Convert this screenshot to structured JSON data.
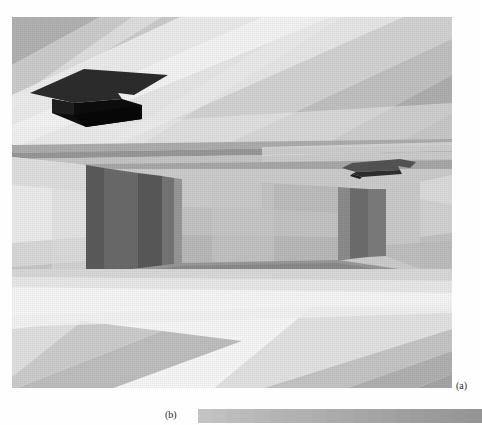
{
  "figure": {
    "panels": [
      {
        "id": "a",
        "label": "(a)",
        "caption_position": "bottom-right",
        "description": "grayscale radiosity rendering of an interior hall with two recessed ceiling luminaires"
      },
      {
        "id": "b",
        "label": "(b)",
        "caption_position": "left",
        "description": "horizontal grayscale intensity scale bar"
      }
    ]
  },
  "scene": {
    "name": "interior-hall-radiosity-render",
    "colors": {
      "ceiling_base": "#d4d4d4",
      "ceiling_bright": "#f4f4f4",
      "ceiling_mid": "#e2e2e2",
      "ceiling_dark": "#b9b9b9",
      "ceiling_darker": "#a6a6a6",
      "beam_face": "#c6c6c6",
      "beam_shadow": "#9d9d9d",
      "beam_highlight": "#ededed",
      "wall_left_light": "#f0f0f0",
      "wall_left_mid": "#dedede",
      "wall_back": "#c9c9c9",
      "wall_back_mid": "#bdbdbd",
      "wall_right": "#d9d9d9",
      "doorway_dark": "#6e6e6e",
      "doorway_darker": "#5a5a5a",
      "pillar": "#8e8e8e",
      "floor_light": "#f3f3f3",
      "floor_white": "#fbfbfb",
      "floor_mid": "#e0e0e0",
      "floor_gray": "#b5b5b5",
      "floor_dark": "#a2a2a2",
      "baseboard": "#909090",
      "luminaire_dark": "#141414",
      "luminaire_face": "#3a3a3a",
      "luminaire_small": "#5e5e5e"
    },
    "luminaires": [
      {
        "name": "ceiling-luminaire-near",
        "x": 18,
        "y": 52,
        "width": 140,
        "height": 56
      },
      {
        "name": "ceiling-luminaire-far",
        "x": 330,
        "y": 142,
        "width": 72,
        "height": 20
      }
    ]
  },
  "scalebar": {
    "name": "grayscale-intensity-scale",
    "x": 198,
    "y": 409,
    "width": 283,
    "height": 14,
    "segments": [
      "#c3c3c3",
      "#c0c0c0",
      "#bcbcbc",
      "#bababa",
      "#b7b7b7",
      "#b4b4b4",
      "#b2b2b2",
      "#b0b0b0",
      "#aeaeae",
      "#ababab",
      "#a9a9a9",
      "#a7a7a7",
      "#a4a4a4",
      "#a2a2a2",
      "#9f9f9f",
      "#9d9d9d",
      "#9b9b9b",
      "#999999",
      "#979797",
      "#959595"
    ]
  }
}
